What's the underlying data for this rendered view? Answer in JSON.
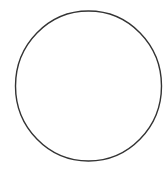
{
  "canvas": {
    "width": 167,
    "height": 186,
    "background": "#ffffff"
  },
  "shape": {
    "type": "circle",
    "cx": 88.5,
    "cy": 86,
    "rx": 73,
    "ry": 75,
    "stroke": "#333333",
    "stroke_width": 1.4,
    "fill": "none"
  }
}
